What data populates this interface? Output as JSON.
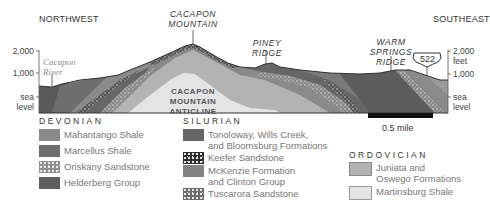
{
  "header": {
    "northwest": "NORTHWEST",
    "southeast": "SOUTHEAST",
    "peaks": {
      "cacapon_mountain": [
        "CACAPON",
        "MOUNTAIN"
      ],
      "piney_ridge": "PINEY RIDGE",
      "warm_springs_ridge": [
        "WARM SPRINGS",
        "RIDGE"
      ]
    }
  },
  "axis_left": {
    "top": "2,000",
    "mid": "1,000",
    "low": [
      "sea",
      "level"
    ]
  },
  "axis_right": {
    "top": "2,000 feet",
    "mid": "1,000",
    "low": [
      "sea",
      "level"
    ]
  },
  "labels": {
    "river": [
      "Cacapon",
      "River"
    ],
    "anticline": [
      "CACAPON",
      "MOUNTAIN",
      "ANTICLINE"
    ],
    "highway": "522"
  },
  "scale_bar": {
    "label": "0.5 mile"
  },
  "legend": {
    "devonian": {
      "title": "DEVONIAN",
      "items": [
        {
          "label": "Mahantango Shale",
          "color": "#8a8a8a"
        },
        {
          "label": "Marcellus Shale",
          "color": "#6e6e6e"
        },
        {
          "label": "Oriskany Sandstone",
          "color": "#9a9a9a",
          "pattern": "dots"
        },
        {
          "label": "Helderberg Group",
          "color": "#5c5c5c"
        }
      ]
    },
    "silurian": {
      "title": "SILURIAN",
      "items": [
        {
          "label": [
            "Tonoloway, Wills Creek,",
            "and Bloomsburg Formations"
          ],
          "color": "#666666"
        },
        {
          "label": "Keefer Sandstone",
          "color": "#2e2e2e",
          "pattern": "dots"
        },
        {
          "label": [
            "McKenzie Formation",
            "and Clinton Group"
          ],
          "color": "#838383"
        },
        {
          "label": "Tuscarora Sandstone",
          "color": "#777777",
          "pattern": "dots"
        }
      ]
    },
    "ordovician": {
      "title": "ORDOVICIAN",
      "items": [
        {
          "label": [
            "Juniata and",
            "Oswego Formations"
          ],
          "color": "#b3b3b3"
        },
        {
          "label": "Martinsburg Shale",
          "color": "#e4e4e4"
        }
      ]
    }
  }
}
